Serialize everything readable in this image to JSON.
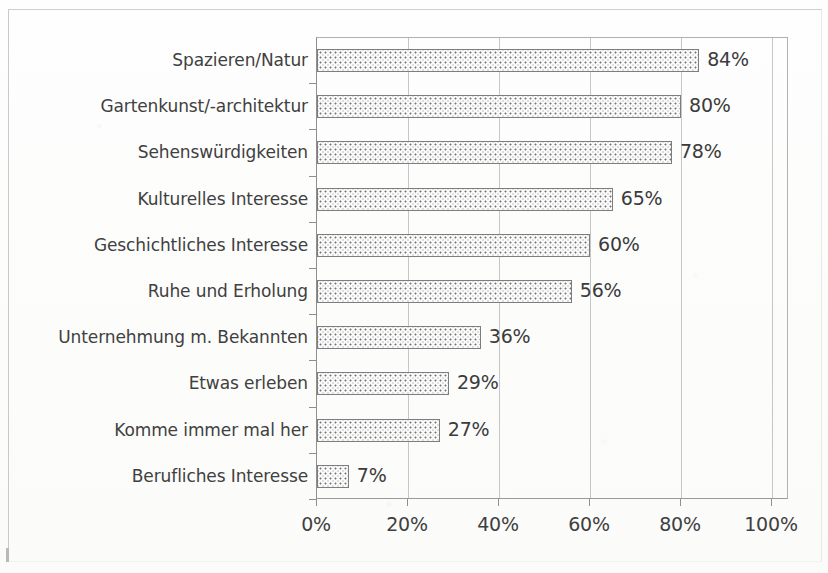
{
  "chart_data": {
    "type": "bar",
    "orientation": "horizontal",
    "title": "",
    "subtitle": "",
    "xlabel": "",
    "ylabel": "",
    "xlim": [
      0,
      100
    ],
    "grid": true,
    "legend": null,
    "value_suffix": "%",
    "categories": [
      "Spazieren/Natur",
      "Gartenkunst/-architektur",
      "Sehenswürdigkeiten",
      "Kulturelles Interesse",
      "Geschichtliches Interesse",
      "Ruhe und Erholung",
      "Unternehmung m. Bekannten",
      "Etwas erleben",
      "Komme immer mal her",
      "Berufliches Interesse"
    ],
    "values": [
      84,
      80,
      78,
      65,
      60,
      56,
      36,
      29,
      27,
      7
    ],
    "data_labels": [
      "84%",
      "80%",
      "78%",
      "65%",
      "60%",
      "56%",
      "36%",
      "29%",
      "27%",
      "7%"
    ],
    "x_ticks": [
      0,
      20,
      40,
      60,
      80,
      100
    ],
    "x_tick_labels": [
      "0%",
      "20%",
      "40%",
      "60%",
      "80%",
      "100%"
    ],
    "bar_fill": "dotted-stipple",
    "colors": {
      "bar_border": "#7d7d7d",
      "bar_fill": "#fafafa",
      "bar_dots": "#767676",
      "gridline": "#c6c6c6",
      "axis": "#8f8f8f",
      "text": "#3f3f3f",
      "background": "#fdfdfc"
    }
  }
}
